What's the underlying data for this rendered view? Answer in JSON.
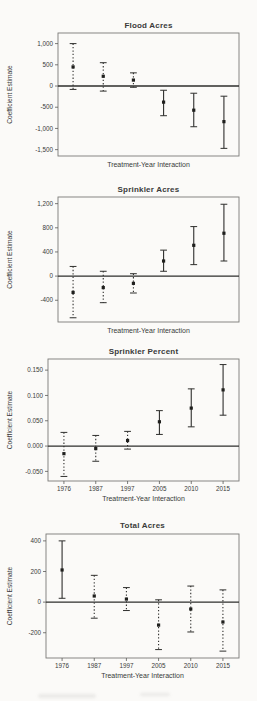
{
  "figure": {
    "background": "#fbfaf8",
    "ink": "#2f2f2d",
    "x_axis_title": "Treatment-Year Interaction",
    "y_axis_title": "Coefficient Estimate"
  },
  "chart_data": [
    {
      "type": "errorbar",
      "title": "Flood Acres",
      "xlabel": "Treatment-Year Interaction",
      "ylabel": "Coefficient Estimate",
      "categories": [
        "1976",
        "1987",
        "1997",
        "2005",
        "2010",
        "2015"
      ],
      "show_x_tick_labels": false,
      "ylim": [
        -1650,
        1250
      ],
      "yticks": [
        {
          "v": 1000,
          "label": "1,000"
        },
        {
          "v": 500,
          "label": "500"
        },
        {
          "v": 0,
          "label": "0"
        },
        {
          "v": -500,
          "label": "-500"
        },
        {
          "v": -1000,
          "label": "-1,000"
        },
        {
          "v": -1500,
          "label": "-1,500"
        }
      ],
      "series": [
        {
          "name": "coefficient",
          "points": [
            {
              "category": "1976",
              "estimate": 450,
              "ci_low": -80,
              "ci_high": 1000,
              "style": "dotted"
            },
            {
              "category": "1987",
              "estimate": 230,
              "ci_low": -120,
              "ci_high": 550,
              "style": "dotted"
            },
            {
              "category": "1997",
              "estimate": 140,
              "ci_low": -30,
              "ci_high": 310,
              "style": "dotted"
            },
            {
              "category": "2005",
              "estimate": -380,
              "ci_low": -700,
              "ci_high": -100,
              "style": "solid"
            },
            {
              "category": "2010",
              "estimate": -570,
              "ci_low": -960,
              "ci_high": -170,
              "style": "solid"
            },
            {
              "category": "2015",
              "estimate": -840,
              "ci_low": -1470,
              "ci_high": -240,
              "style": "solid"
            }
          ]
        }
      ]
    },
    {
      "type": "errorbar",
      "title": "Sprinkler Acres",
      "xlabel": "Treatment-Year Interaction",
      "ylabel": "Coefficient Estimate",
      "categories": [
        "1976",
        "1987",
        "1997",
        "2005",
        "2010",
        "2015"
      ],
      "show_x_tick_labels": false,
      "ylim": [
        -760,
        1310
      ],
      "yticks": [
        {
          "v": 1200,
          "label": "1,200"
        },
        {
          "v": 800,
          "label": "800"
        },
        {
          "v": 400,
          "label": "400"
        },
        {
          "v": 0,
          "label": "0"
        },
        {
          "v": -400,
          "label": "-400"
        }
      ],
      "series": [
        {
          "name": "coefficient",
          "points": [
            {
              "category": "1976",
              "estimate": -270,
              "ci_low": -690,
              "ci_high": 160,
              "style": "dotted"
            },
            {
              "category": "1987",
              "estimate": -190,
              "ci_low": -440,
              "ci_high": 80,
              "style": "dotted"
            },
            {
              "category": "1997",
              "estimate": -120,
              "ci_low": -280,
              "ci_high": 40,
              "style": "dotted"
            },
            {
              "category": "2005",
              "estimate": 250,
              "ci_low": 80,
              "ci_high": 430,
              "style": "solid"
            },
            {
              "category": "2010",
              "estimate": 510,
              "ci_low": 190,
              "ci_high": 820,
              "style": "solid"
            },
            {
              "category": "2015",
              "estimate": 710,
              "ci_low": 250,
              "ci_high": 1190,
              "style": "solid"
            }
          ]
        }
      ]
    },
    {
      "type": "errorbar",
      "title": "Sprinkler Percent",
      "xlabel": "Treatment-Year Interaction",
      "ylabel": "Coefficient Estimate",
      "categories": [
        "1976",
        "1987",
        "1997",
        "2005",
        "2010",
        "2015"
      ],
      "show_x_tick_labels": true,
      "ylim": [
        -0.069,
        0.172
      ],
      "yticks": [
        {
          "v": 0.15,
          "label": "0.150"
        },
        {
          "v": 0.1,
          "label": "0.100"
        },
        {
          "v": 0.05,
          "label": "0.050"
        },
        {
          "v": 0,
          "label": "0.000"
        },
        {
          "v": -0.05,
          "label": "-0.050"
        }
      ],
      "series": [
        {
          "name": "coefficient",
          "points": [
            {
              "category": "1976",
              "estimate": -0.015,
              "ci_low": -0.06,
              "ci_high": 0.027,
              "style": "dotted"
            },
            {
              "category": "1987",
              "estimate": -0.005,
              "ci_low": -0.03,
              "ci_high": 0.021,
              "style": "dotted"
            },
            {
              "category": "1997",
              "estimate": 0.011,
              "ci_low": -0.006,
              "ci_high": 0.029,
              "style": "dotted"
            },
            {
              "category": "2005",
              "estimate": 0.048,
              "ci_low": 0.023,
              "ci_high": 0.07,
              "style": "solid"
            },
            {
              "category": "2010",
              "estimate": 0.075,
              "ci_low": 0.038,
              "ci_high": 0.113,
              "style": "solid"
            },
            {
              "category": "2015",
              "estimate": 0.111,
              "ci_low": 0.061,
              "ci_high": 0.161,
              "style": "solid"
            }
          ]
        }
      ]
    },
    {
      "type": "errorbar",
      "title": "Total Acres",
      "xlabel": "Treatment-Year Interaction",
      "ylabel": "Coefficient Estimate",
      "categories": [
        "1976",
        "1987",
        "1997",
        "2005",
        "2010",
        "2015"
      ],
      "show_x_tick_labels": true,
      "ylim": [
        -365,
        445
      ],
      "yticks": [
        {
          "v": 400,
          "label": "400"
        },
        {
          "v": 200,
          "label": "200"
        },
        {
          "v": 0,
          "label": "0"
        },
        {
          "v": -200,
          "label": "-200"
        }
      ],
      "series": [
        {
          "name": "coefficient",
          "points": [
            {
              "category": "1976",
              "estimate": 210,
              "ci_low": 25,
              "ci_high": 400,
              "style": "solid"
            },
            {
              "category": "1987",
              "estimate": 40,
              "ci_low": -105,
              "ci_high": 175,
              "style": "dotted"
            },
            {
              "category": "1997",
              "estimate": 20,
              "ci_low": -55,
              "ci_high": 95,
              "style": "dotted"
            },
            {
              "category": "2005",
              "estimate": -150,
              "ci_low": -310,
              "ci_high": 15,
              "style": "dotted"
            },
            {
              "category": "2010",
              "estimate": -45,
              "ci_low": -195,
              "ci_high": 105,
              "style": "dotted"
            },
            {
              "category": "2015",
              "estimate": -130,
              "ci_low": -320,
              "ci_high": 80,
              "style": "dotted"
            }
          ]
        }
      ]
    }
  ]
}
